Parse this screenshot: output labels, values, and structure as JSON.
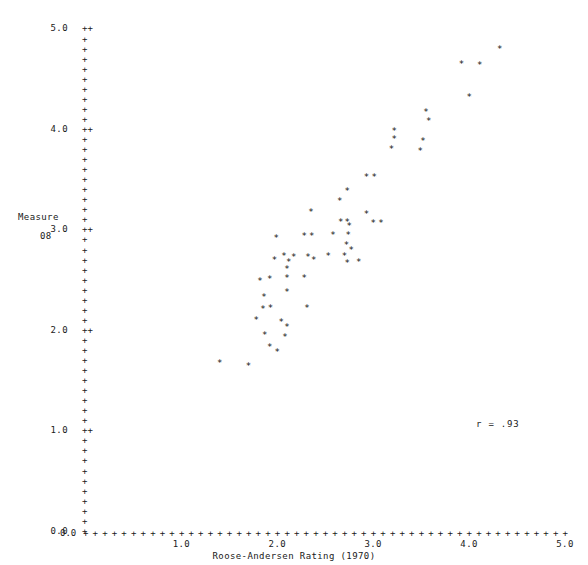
{
  "chart_data": {
    "type": "scatter",
    "title": "",
    "xlabel": "Roose-Andersen Rating (1970)",
    "ylabel": "Measure",
    "ylabel_line2": "08",
    "xlim": [
      0.0,
      5.0
    ],
    "ylim": [
      0.0,
      5.0
    ],
    "xticks": [
      0.0,
      1.0,
      2.0,
      3.0,
      4.0,
      5.0
    ],
    "yticks": [
      0.0,
      1.0,
      2.0,
      3.0,
      4.0,
      5.0
    ],
    "xtick_labels": [
      "0.0",
      "1.0",
      "2.0",
      "3.0",
      "4.0",
      "5.0"
    ],
    "ytick_labels": [
      "0.0",
      "1.0",
      "2.0",
      "3.0",
      "4.0",
      "5.0"
    ],
    "minor_ticks_per_major": 10,
    "grid": false,
    "legend": null,
    "marker": "*",
    "tick_glyph": "+",
    "annotation": "r = .93",
    "correlation": 0.93,
    "points": [
      {
        "x": 1.4,
        "y": 1.67
      },
      {
        "x": 1.7,
        "y": 1.64
      },
      {
        "x": 1.92,
        "y": 1.83
      },
      {
        "x": 2.0,
        "y": 1.78
      },
      {
        "x": 1.87,
        "y": 1.95
      },
      {
        "x": 2.08,
        "y": 1.93
      },
      {
        "x": 2.1,
        "y": 2.03
      },
      {
        "x": 1.78,
        "y": 2.1
      },
      {
        "x": 2.04,
        "y": 2.08
      },
      {
        "x": 1.85,
        "y": 2.21
      },
      {
        "x": 1.93,
        "y": 2.22
      },
      {
        "x": 2.31,
        "y": 2.22
      },
      {
        "x": 1.86,
        "y": 2.33
      },
      {
        "x": 2.1,
        "y": 2.38
      },
      {
        "x": 1.82,
        "y": 2.49
      },
      {
        "x": 1.92,
        "y": 2.51
      },
      {
        "x": 2.1,
        "y": 2.52
      },
      {
        "x": 2.28,
        "y": 2.52
      },
      {
        "x": 2.1,
        "y": 2.61
      },
      {
        "x": 2.12,
        "y": 2.68
      },
      {
        "x": 1.97,
        "y": 2.7
      },
      {
        "x": 2.07,
        "y": 2.74
      },
      {
        "x": 2.17,
        "y": 2.73
      },
      {
        "x": 2.32,
        "y": 2.73
      },
      {
        "x": 2.53,
        "y": 2.74
      },
      {
        "x": 2.7,
        "y": 2.74
      },
      {
        "x": 2.38,
        "y": 2.7
      },
      {
        "x": 2.73,
        "y": 2.67
      },
      {
        "x": 2.85,
        "y": 2.68
      },
      {
        "x": 2.77,
        "y": 2.8
      },
      {
        "x": 2.72,
        "y": 2.85
      },
      {
        "x": 1.99,
        "y": 2.92
      },
      {
        "x": 2.28,
        "y": 2.94
      },
      {
        "x": 2.36,
        "y": 2.94
      },
      {
        "x": 2.58,
        "y": 2.95
      },
      {
        "x": 2.74,
        "y": 2.95
      },
      {
        "x": 2.75,
        "y": 3.03
      },
      {
        "x": 2.66,
        "y": 3.07
      },
      {
        "x": 2.73,
        "y": 3.07
      },
      {
        "x": 3.0,
        "y": 3.06
      },
      {
        "x": 3.08,
        "y": 3.06
      },
      {
        "x": 2.93,
        "y": 3.15
      },
      {
        "x": 2.35,
        "y": 3.17
      },
      {
        "x": 2.65,
        "y": 3.28
      },
      {
        "x": 2.73,
        "y": 3.38
      },
      {
        "x": 2.93,
        "y": 3.52
      },
      {
        "x": 3.01,
        "y": 3.52
      },
      {
        "x": 3.19,
        "y": 3.8
      },
      {
        "x": 3.22,
        "y": 3.9
      },
      {
        "x": 3.22,
        "y": 3.98
      },
      {
        "x": 3.49,
        "y": 3.78
      },
      {
        "x": 3.52,
        "y": 3.88
      },
      {
        "x": 3.58,
        "y": 4.08
      },
      {
        "x": 3.55,
        "y": 4.17
      },
      {
        "x": 4.0,
        "y": 4.32
      },
      {
        "x": 3.92,
        "y": 4.65
      },
      {
        "x": 4.11,
        "y": 4.64
      },
      {
        "x": 4.32,
        "y": 4.8
      }
    ]
  },
  "axis": {
    "y_rows": [
      {
        "label": "5.0",
        "tick": "++",
        "major": true
      },
      {
        "label": "",
        "tick": "+",
        "major": false
      },
      {
        "label": "",
        "tick": "+",
        "major": false
      },
      {
        "label": "",
        "tick": "+",
        "major": false
      },
      {
        "label": "",
        "tick": "+",
        "major": false
      },
      {
        "label": "",
        "tick": "+",
        "major": false
      },
      {
        "label": "",
        "tick": "+",
        "major": false
      },
      {
        "label": "",
        "tick": "+",
        "major": false
      },
      {
        "label": "",
        "tick": "+",
        "major": false
      },
      {
        "label": "",
        "tick": "+",
        "major": false
      },
      {
        "label": "4.0",
        "tick": "++",
        "major": true
      },
      {
        "label": "",
        "tick": "+",
        "major": false
      },
      {
        "label": "",
        "tick": "+",
        "major": false
      },
      {
        "label": "",
        "tick": "+",
        "major": false
      },
      {
        "label": "",
        "tick": "+",
        "major": false
      },
      {
        "label": "",
        "tick": "+",
        "major": false
      },
      {
        "label": "",
        "tick": "+",
        "major": false
      },
      {
        "label": "",
        "tick": "+",
        "major": false
      },
      {
        "label": "",
        "tick": "+",
        "major": false
      },
      {
        "label": "",
        "tick": "+",
        "major": false
      },
      {
        "label": "3.0",
        "tick": "++",
        "major": true
      },
      {
        "label": "",
        "tick": "+",
        "major": false
      },
      {
        "label": "",
        "tick": "+",
        "major": false
      },
      {
        "label": "",
        "tick": "+",
        "major": false
      },
      {
        "label": "",
        "tick": "+",
        "major": false
      },
      {
        "label": "",
        "tick": "+",
        "major": false
      },
      {
        "label": "",
        "tick": "+",
        "major": false
      },
      {
        "label": "",
        "tick": "+",
        "major": false
      },
      {
        "label": "",
        "tick": "+",
        "major": false
      },
      {
        "label": "",
        "tick": "+",
        "major": false
      },
      {
        "label": "2.0",
        "tick": "++",
        "major": true
      },
      {
        "label": "",
        "tick": "+",
        "major": false
      },
      {
        "label": "",
        "tick": "+",
        "major": false
      },
      {
        "label": "",
        "tick": "+",
        "major": false
      },
      {
        "label": "",
        "tick": "+",
        "major": false
      },
      {
        "label": "",
        "tick": "+",
        "major": false
      },
      {
        "label": "",
        "tick": "+",
        "major": false
      },
      {
        "label": "",
        "tick": "+",
        "major": false
      },
      {
        "label": "",
        "tick": "+",
        "major": false
      },
      {
        "label": "",
        "tick": "+",
        "major": false
      },
      {
        "label": "1.0",
        "tick": "++",
        "major": true
      },
      {
        "label": "",
        "tick": "+",
        "major": false
      },
      {
        "label": "",
        "tick": "+",
        "major": false
      },
      {
        "label": "",
        "tick": "+",
        "major": false
      },
      {
        "label": "",
        "tick": "+",
        "major": false
      },
      {
        "label": "",
        "tick": "+",
        "major": false
      },
      {
        "label": "",
        "tick": "+",
        "major": false
      },
      {
        "label": "",
        "tick": "+",
        "major": false
      },
      {
        "label": "",
        "tick": "+",
        "major": false
      },
      {
        "label": "",
        "tick": "+",
        "major": false
      },
      {
        "label": "0.0",
        "tick": "+",
        "major": true
      }
    ],
    "x_tick_count": 51,
    "x_origin_label": "0.0"
  },
  "colors": {
    "background": "#ffffff",
    "ink": "#1a1a1a",
    "marker": "#111111",
    "tick": "#2b2b2b"
  }
}
